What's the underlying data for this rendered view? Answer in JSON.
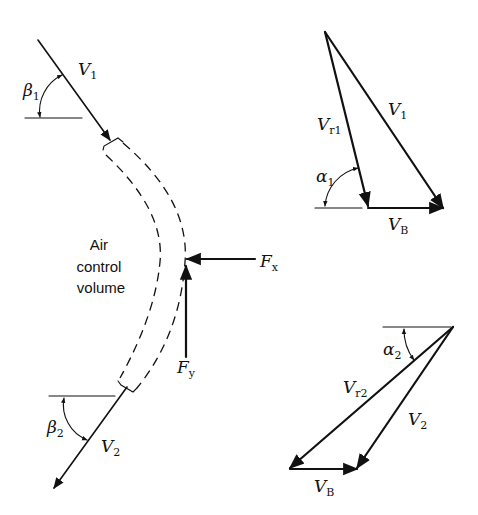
{
  "figure": {
    "control_volume": {
      "label_lines": [
        "Air",
        "control",
        "volume"
      ]
    },
    "inlet": {
      "velocity": {
        "symbol": "V",
        "subscript": "1"
      },
      "angle": {
        "symbol": "β",
        "subscript": "1"
      }
    },
    "outlet": {
      "velocity": {
        "symbol": "V",
        "subscript": "2"
      },
      "angle": {
        "symbol": "β",
        "subscript": "2"
      }
    },
    "forces": {
      "fx": {
        "symbol": "F",
        "subscript": "x"
      },
      "fy": {
        "symbol": "F",
        "subscript": "y"
      }
    },
    "inlet_triangle": {
      "absolute": {
        "symbol": "V",
        "subscript": "1"
      },
      "relative": {
        "symbol": "V",
        "subscript": "r1"
      },
      "blade": {
        "symbol": "V",
        "subscript": "B"
      },
      "angle": {
        "symbol": "α",
        "subscript": "1"
      }
    },
    "outlet_triangle": {
      "absolute": {
        "symbol": "V",
        "subscript": "2"
      },
      "relative": {
        "symbol": "V",
        "subscript": "r2"
      },
      "blade": {
        "symbol": "V",
        "subscript": "B"
      },
      "angle": {
        "symbol": "α",
        "subscript": "2"
      }
    }
  }
}
